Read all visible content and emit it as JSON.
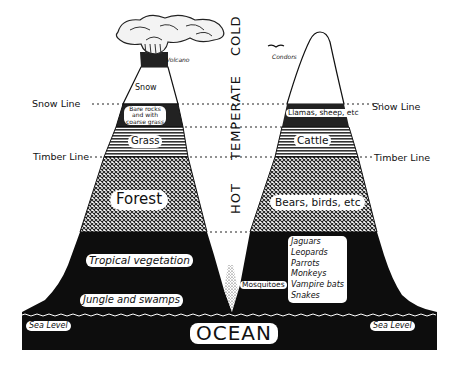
{
  "diagram": {
    "climate_zones": [
      "HOT",
      "TEMPERATE",
      "COLD"
    ],
    "altitude_lines": {
      "snow_line_label": "Snow Line",
      "timber_line_label": "Timber Line",
      "sea_level_label": "Sea Level"
    },
    "ocean_label": "OCEAN",
    "left_mountain": {
      "name": "Volcano",
      "zones": [
        {
          "name": "snow",
          "label": "Snow"
        },
        {
          "name": "bare-rocks",
          "label_line1": "Bare rocks",
          "label_line2": "and with",
          "label_line3": "coarse grass"
        },
        {
          "name": "grass",
          "label": "Grass"
        },
        {
          "name": "forest",
          "label": "Forest"
        },
        {
          "name": "tropical",
          "label": "Tropical vegetation"
        },
        {
          "name": "jungle",
          "label": "Jungle and swamps"
        }
      ]
    },
    "right_mountain": {
      "bird_label": "Condors",
      "zones": [
        {
          "name": "llamas",
          "label": "Llamas, sheep, etc"
        },
        {
          "name": "cattle",
          "label": "Cattle"
        },
        {
          "name": "forest",
          "label": "Bears, birds, etc"
        }
      ],
      "tropical_animals": [
        "Jaguars",
        "Leopards",
        "Parrots",
        "Monkeys",
        "Vampire bats",
        "Snakes"
      ]
    },
    "valley_label": "Mosquitoes",
    "colors": {
      "ink": "#111111",
      "paper": "#ffffff",
      "hatch_grey": "#777777"
    }
  }
}
